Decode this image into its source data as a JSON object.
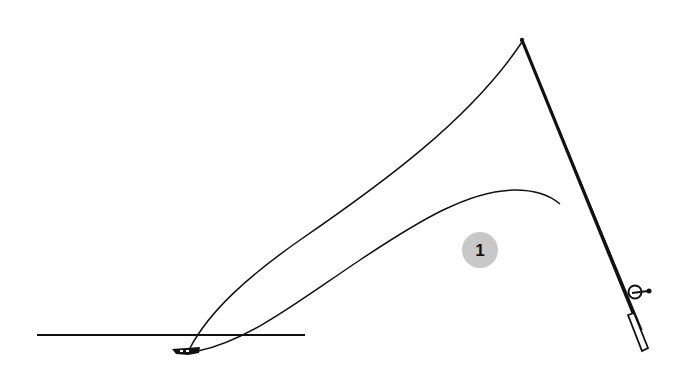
{
  "diagram": {
    "callouts": [
      {
        "id": "callout-1",
        "label": "1",
        "fill": "#c8c8c8"
      }
    ],
    "colors": {
      "ink": "#111111",
      "background": "#ffffff",
      "callout_fill": "#c8c8c8"
    },
    "elements": [
      "water-line",
      "fishing-rod",
      "reel",
      "upper-line",
      "lower-line",
      "lure"
    ]
  }
}
